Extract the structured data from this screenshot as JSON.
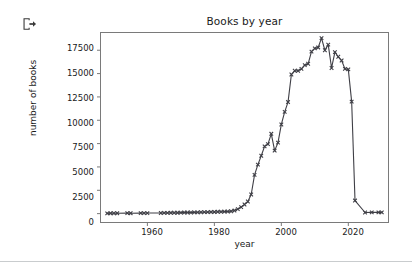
{
  "toolbar": {
    "icon_name": "logout-export-icon",
    "icon_title": "Export"
  },
  "colors": {
    "line": "#3f3f46",
    "marker": "#3f3f46",
    "axis": "#666666",
    "text": "#1a1a1a",
    "background": "#ffffff",
    "rule": "#c9ccce"
  },
  "chart_data": {
    "type": "line",
    "title": "Books by year",
    "xlabel": "year",
    "ylabel": "number of books",
    "grid": false,
    "legend": null,
    "marker": "x",
    "xlim": [
      1946,
      2032
    ],
    "ylim": [
      -950,
      19400
    ],
    "xticks": [
      1960,
      1980,
      2000,
      2020
    ],
    "yticks": [
      0,
      2500,
      5000,
      7500,
      10000,
      12500,
      15000,
      17500
    ],
    "xtick_labels": [
      "1960",
      "1980",
      "2000",
      "2020"
    ],
    "ytick_labels": [
      "0",
      "2500",
      "5000",
      "7500",
      "10000",
      "12500",
      "15000",
      "17500"
    ],
    "x": [
      1948,
      1949,
      1950,
      1951,
      1954,
      1955,
      1958,
      1959,
      1960,
      1964,
      1965,
      1966,
      1967,
      1968,
      1969,
      1970,
      1971,
      1972,
      1973,
      1974,
      1975,
      1976,
      1977,
      1978,
      1979,
      1980,
      1981,
      1982,
      1983,
      1984,
      1985,
      1986,
      1987,
      1988,
      1989,
      1990,
      1991,
      1992,
      1993,
      1994,
      1995,
      1996,
      1997,
      1998,
      1999,
      2000,
      2001,
      2002,
      2003,
      2004,
      2005,
      2006,
      2007,
      2008,
      2009,
      2010,
      2011,
      2012,
      2013,
      2014,
      2015,
      2016,
      2017,
      2018,
      2019,
      2020,
      2021,
      2022,
      2025,
      2027,
      2029,
      2030
    ],
    "y": [
      30,
      35,
      40,
      45,
      50,
      45,
      55,
      60,
      60,
      70,
      80,
      85,
      90,
      95,
      100,
      110,
      115,
      120,
      120,
      130,
      140,
      150,
      155,
      160,
      170,
      180,
      195,
      205,
      215,
      230,
      250,
      330,
      480,
      700,
      980,
      1300,
      2050,
      4150,
      5250,
      6200,
      7200,
      7450,
      8550,
      6750,
      7600,
      9550,
      10900,
      11950,
      14900,
      15300,
      15300,
      15500,
      15900,
      16050,
      17350,
      17700,
      17800,
      18800,
      17500,
      18100,
      15600,
      17300,
      16800,
      16400,
      15500,
      15450,
      12000,
      1400,
      120,
      130,
      140,
      130
    ],
    "series": [
      {
        "name": "number of books",
        "values": [
          30,
          35,
          40,
          45,
          50,
          45,
          55,
          60,
          60,
          70,
          80,
          85,
          90,
          95,
          100,
          110,
          115,
          120,
          120,
          130,
          140,
          150,
          155,
          160,
          170,
          180,
          195,
          205,
          215,
          230,
          250,
          330,
          480,
          700,
          980,
          1300,
          2050,
          4150,
          5250,
          6200,
          7200,
          7450,
          8550,
          6750,
          7600,
          9550,
          10900,
          11950,
          14900,
          15300,
          15300,
          15500,
          15900,
          16050,
          17350,
          17700,
          17800,
          18800,
          17500,
          18100,
          15600,
          17300,
          16800,
          16400,
          15500,
          15450,
          12000,
          1400,
          120,
          130,
          140,
          130
        ]
      }
    ]
  }
}
